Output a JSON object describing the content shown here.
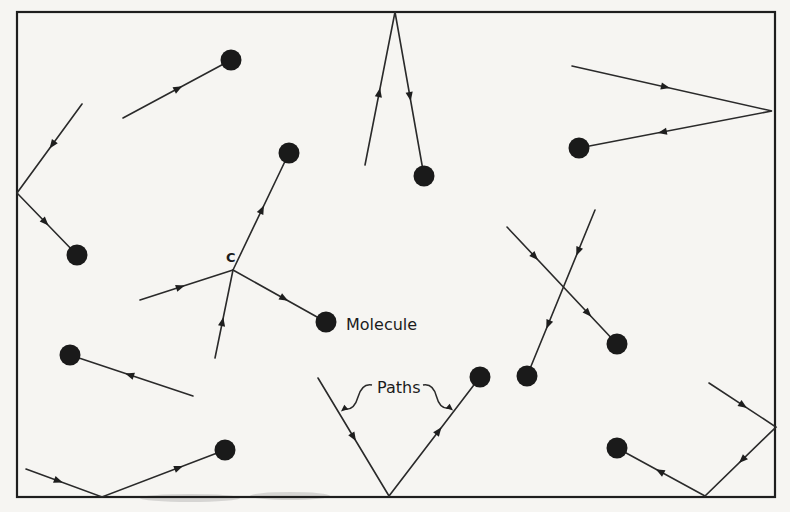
{
  "figure": {
    "labels": {
      "molecule": "Molecule",
      "paths": "Paths",
      "collision_point": "C"
    },
    "colors": {
      "background": "#f6f5f2",
      "ink": "#1a1a1a"
    },
    "container": {
      "x": 17,
      "y": 12,
      "width": 758,
      "height": 485
    },
    "molecules": [
      {
        "id": "m1",
        "cx": 231,
        "cy": 60
      },
      {
        "id": "m2",
        "cx": 77,
        "cy": 255
      },
      {
        "id": "m3",
        "cx": 289,
        "cy": 153
      },
      {
        "id": "m4",
        "cx": 326,
        "cy": 322,
        "label": "Molecule"
      },
      {
        "id": "m5",
        "cx": 424,
        "cy": 176
      },
      {
        "id": "m6",
        "cx": 579,
        "cy": 148
      },
      {
        "id": "m7",
        "cx": 617,
        "cy": 344
      },
      {
        "id": "m8",
        "cx": 527,
        "cy": 376
      },
      {
        "id": "m9",
        "cx": 480,
        "cy": 377
      },
      {
        "id": "m10",
        "cx": 70,
        "cy": 355
      },
      {
        "id": "m11",
        "cx": 225,
        "cy": 450
      },
      {
        "id": "m12",
        "cx": 617,
        "cy": 448
      }
    ],
    "paths": [
      {
        "id": "p1",
        "points": [
          [
            123,
            118
          ],
          [
            231,
            60
          ]
        ],
        "arrows": [
          [
            178,
            89,
            "forward"
          ]
        ]
      },
      {
        "id": "p2",
        "points": [
          [
            82,
            104
          ],
          [
            17,
            193
          ],
          [
            77,
            255
          ]
        ],
        "arrows": [
          [
            52,
            144,
            "forward"
          ],
          [
            45,
            222,
            "forward"
          ]
        ]
      },
      {
        "id": "p3",
        "points": [
          [
            140,
            300
          ],
          [
            233,
            270
          ]
        ],
        "arrows": [
          [
            180,
            287,
            "forward"
          ]
        ]
      },
      {
        "id": "p4",
        "points": [
          [
            215,
            358
          ],
          [
            233,
            270
          ]
        ],
        "arrows": [
          [
            222,
            322,
            "forward"
          ]
        ]
      },
      {
        "id": "p5",
        "points": [
          [
            233,
            270
          ],
          [
            289,
            153
          ]
        ],
        "arrows": [
          [
            262,
            210,
            "forward"
          ]
        ]
      },
      {
        "id": "p6",
        "points": [
          [
            233,
            270
          ],
          [
            326,
            322
          ]
        ],
        "arrows": [
          [
            284,
            298,
            "forward"
          ]
        ]
      },
      {
        "id": "p7",
        "points": [
          [
            365,
            165
          ],
          [
            395,
            12
          ],
          [
            424,
            176
          ]
        ],
        "arrows": [
          [
            379,
            93,
            "forward"
          ],
          [
            410,
            96,
            "forward"
          ]
        ]
      },
      {
        "id": "p8",
        "points": [
          [
            572,
            66
          ],
          [
            772,
            111
          ],
          [
            579,
            148
          ]
        ],
        "arrows": [
          [
            665,
            87,
            "forward"
          ],
          [
            663,
            133,
            "forward"
          ]
        ]
      },
      {
        "id": "p9",
        "points": [
          [
            507,
            227
          ],
          [
            617,
            344
          ]
        ],
        "arrows": [
          [
            535,
            256,
            "forward"
          ],
          [
            588,
            313,
            "forward"
          ]
        ]
      },
      {
        "id": "p10",
        "points": [
          [
            595,
            210
          ],
          [
            527,
            376
          ]
        ],
        "arrows": [
          [
            578,
            251,
            "forward"
          ],
          [
            548,
            324,
            "forward"
          ]
        ]
      },
      {
        "id": "p11",
        "points": [
          [
            193,
            396
          ],
          [
            70,
            355
          ]
        ],
        "arrows": [
          [
            130,
            375,
            "forward"
          ]
        ]
      },
      {
        "id": "p12",
        "points": [
          [
            26,
            469
          ],
          [
            102,
            497
          ],
          [
            225,
            450
          ]
        ],
        "arrows": [
          [
            58,
            481,
            "forward"
          ],
          [
            178,
            467,
            "forward"
          ]
        ]
      },
      {
        "id": "p13",
        "points": [
          [
            318,
            378
          ],
          [
            389,
            496
          ],
          [
            480,
            377
          ]
        ],
        "arrows": [
          [
            353,
            437,
            "forward"
          ],
          [
            438,
            431,
            "forward"
          ]
        ]
      },
      {
        "id": "p14",
        "points": [
          [
            709,
            383
          ],
          [
            776,
            427
          ],
          [
            705,
            496
          ],
          [
            617,
            448
          ]
        ],
        "arrows": [
          [
            743,
            405,
            "forward"
          ],
          [
            743,
            460,
            "forward"
          ],
          [
            660,
            472,
            "forward"
          ]
        ]
      }
    ],
    "annotations": {
      "c_label_pos": [
        226,
        262
      ],
      "molecule_label_pos": [
        346,
        330
      ],
      "paths_label_pos": [
        377,
        393
      ],
      "paths_leaders": [
        {
          "from": [
            372,
            385
          ],
          "to": [
            344,
            409
          ]
        },
        {
          "from": [
            423,
            385
          ],
          "to": [
            450,
            408
          ]
        }
      ]
    }
  }
}
